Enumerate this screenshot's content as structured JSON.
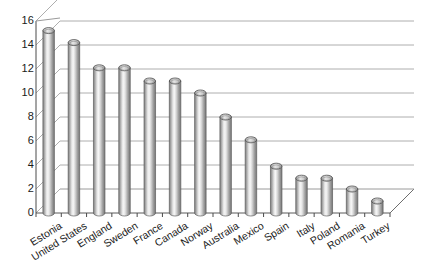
{
  "chart_data": {
    "type": "bar",
    "title": "",
    "subtitle": "",
    "xlabel": "",
    "ylabel": "",
    "categories": [
      "Estonia",
      "United States",
      "England",
      "Sweden",
      "France",
      "Canada",
      "Norway",
      "Australia",
      "Mexico",
      "Spain",
      "Italy",
      "Poland",
      "Romania",
      "Turkey"
    ],
    "values": [
      15.2,
      14.2,
      12.1,
      12.1,
      11.0,
      11.0,
      10.0,
      8.0,
      6.1,
      3.9,
      2.9,
      2.9,
      2.0,
      1.0
    ],
    "series": [
      {
        "name": "",
        "values": [
          15.2,
          14.2,
          12.1,
          12.1,
          11.0,
          11.0,
          10.0,
          8.0,
          6.1,
          3.9,
          2.9,
          2.9,
          2.0,
          1.0
        ]
      }
    ],
    "ylim": [
      0,
      16
    ],
    "ytick_step": 2,
    "yticks": [
      "16",
      "14",
      "12",
      "10",
      "8",
      "6",
      "4",
      "2",
      "0"
    ],
    "ytick_values": [
      16,
      14,
      12,
      10,
      8,
      6,
      4,
      2,
      0
    ],
    "grid": true,
    "grid_axis": "y",
    "legend": false,
    "legend_position": "none",
    "style": "3d-cylinder",
    "annotations": []
  },
  "colors": {
    "background": "#ffffff",
    "bar_light": "#f2f2f2",
    "bar_mid": "#bcbcbc",
    "bar_dark": "#7e7e7e",
    "bar_edge": "#4d4d4d",
    "grid": "#aeaeae",
    "axis": "#4a4a4a",
    "floor": "#ffffff",
    "text": "#1a1a1a"
  }
}
